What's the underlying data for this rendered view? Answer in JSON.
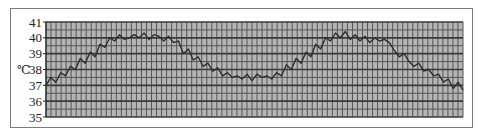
{
  "chart_data": {
    "type": "line",
    "title": "",
    "xlabel": "",
    "ylabel": "℃",
    "ylim": [
      35,
      41
    ],
    "yticks": [
      35,
      36,
      37,
      38,
      39,
      40,
      41
    ],
    "grid": true,
    "legend": null,
    "series": [
      {
        "name": "temperature",
        "color": "#333333",
        "x": [
          0,
          1,
          2,
          3,
          4,
          5,
          6,
          7,
          8,
          9,
          10,
          11,
          12,
          13,
          14,
          15,
          16,
          17,
          18,
          19,
          20,
          21,
          22,
          23,
          24,
          25,
          26,
          27,
          28,
          29,
          30,
          31,
          32,
          33,
          34,
          35,
          36,
          37,
          38,
          39,
          40,
          41,
          42,
          43,
          44,
          45,
          46,
          47
        ],
        "values": [
          37.0,
          37.5,
          37.2,
          37.8,
          37.6,
          38.2,
          38.0,
          38.7,
          38.4,
          39.1,
          38.8,
          39.6,
          39.4,
          40.0,
          39.8,
          40.2,
          39.9,
          40.0,
          40.2,
          40.0,
          40.3,
          39.9,
          40.2,
          40.1,
          39.8,
          40.1,
          39.7,
          39.8,
          39.0,
          39.3,
          38.6,
          38.8,
          38.2,
          38.4,
          37.9,
          38.1,
          37.6,
          37.8,
          37.5,
          37.6,
          37.4,
          37.7,
          37.3,
          37.7,
          37.5,
          37.6,
          37.4,
          37.8
        ]
      }
    ],
    "series_continued": {
      "values": [
        37.6,
        38.3,
        38.0,
        38.7,
        38.4,
        39.1,
        38.8,
        39.6,
        39.3,
        40.0,
        39.8,
        40.3,
        40.0,
        40.4,
        39.9,
        40.2,
        39.8,
        40.1,
        39.7,
        40.0,
        39.8,
        39.9,
        39.7,
        39.2,
        38.8,
        39.0,
        38.5,
        38.2,
        38.4,
        37.9,
        38.0,
        37.6,
        37.7,
        37.2,
        37.4,
        36.8,
        37.2,
        36.7
      ]
    }
  },
  "axis": {
    "unit": "℃",
    "tick_labels": [
      "41",
      "40",
      "39",
      "38",
      "37",
      "36",
      "35"
    ]
  },
  "colors": {
    "plot_background": "#b5b5b5",
    "grid_major": "#3a3a3a",
    "grid_minor": "#555555",
    "line": "#2e2e2e",
    "frame": "#7a7a7a"
  }
}
